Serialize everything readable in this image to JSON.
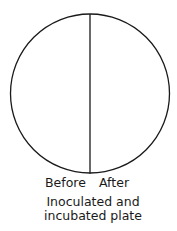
{
  "diagram": {
    "type": "petri-plate",
    "left_label": "Before",
    "right_label": "After",
    "caption_line1": "Inoculated and",
    "caption_line2": "incubated plate",
    "stroke_color": "#1a1a1a"
  }
}
